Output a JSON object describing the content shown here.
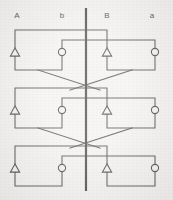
{
  "figure": {
    "background_color": "#f2f1ef",
    "line_color": "#3a3a3a",
    "axis_color": "#2b2b2b",
    "width": 173,
    "height": 200
  },
  "labels": {
    "top_row": [
      {
        "id": "label-A",
        "text": "A",
        "x": 17,
        "y": 18
      },
      {
        "id": "label-b",
        "text": "b",
        "x": 62,
        "y": 18
      },
      {
        "id": "label-B",
        "text": "B",
        "x": 107,
        "y": 18
      },
      {
        "id": "label-a",
        "text": "a",
        "x": 152,
        "y": 18
      }
    ]
  },
  "mirror_axis": {
    "name": "center-vertical-axis",
    "x": 86,
    "y_start": 8,
    "y_end": 191
  },
  "columns": {
    "left_outer_x": 15,
    "left_inner_x": 62,
    "right_inner_x": 107,
    "right_outer_x": 155
  },
  "rows": [
    {
      "index": 0,
      "symbol_y": 52,
      "top_y": 30,
      "bottom_y": 70
    },
    {
      "index": 1,
      "symbol_y": 110,
      "top_y": 88,
      "bottom_y": 128
    },
    {
      "index": 2,
      "symbol_y": 168,
      "top_y": 146,
      "bottom_y": 186
    }
  ],
  "symbols": {
    "triangle": {
      "icon_name": "triangle-node-icon",
      "glyph": "triangle",
      "half_width": 4.6,
      "height": 8.2,
      "count": 6
    },
    "circle": {
      "icon_name": "circle-node-icon",
      "glyph": "circle",
      "radius": 3.6,
      "count": 6
    }
  },
  "cells": [
    {
      "name": "cell-row0-left",
      "row": 0,
      "side": "left",
      "triangle_x": 15,
      "circle_x": 62,
      "symbol_y": 52,
      "top_y": 30,
      "bottom_y": 70,
      "top_extent_x": 86,
      "bottom_extent_x": 62
    },
    {
      "name": "cell-row0-right",
      "row": 0,
      "side": "right",
      "triangle_x": 107,
      "circle_x": 155,
      "symbol_y": 52,
      "top_y": 30,
      "bottom_y": 70,
      "top_extent_x": 86,
      "bottom_extent_x": 107
    },
    {
      "name": "cell-row1-left",
      "row": 1,
      "side": "left",
      "triangle_x": 15,
      "circle_x": 62,
      "symbol_y": 110,
      "top_y": 88,
      "bottom_y": 128,
      "top_extent_x": 86,
      "bottom_extent_x": 62
    },
    {
      "name": "cell-row1-right",
      "row": 1,
      "side": "right",
      "triangle_x": 107,
      "circle_x": 155,
      "symbol_y": 110,
      "top_y": 88,
      "bottom_y": 128,
      "top_extent_x": 86,
      "bottom_extent_x": 107
    },
    {
      "name": "cell-row2-left",
      "row": 2,
      "side": "left",
      "triangle_x": 15,
      "circle_x": 62,
      "symbol_y": 168,
      "top_y": 146,
      "bottom_y": 186,
      "top_extent_x": 86,
      "bottom_extent_x": 62
    },
    {
      "name": "cell-row2-right",
      "row": 2,
      "side": "right",
      "triangle_x": 107,
      "circle_x": 155,
      "symbol_y": 168,
      "top_y": 146,
      "bottom_y": 186,
      "top_extent_x": 86,
      "bottom_extent_x": 107
    }
  ],
  "cross_links": [
    {
      "name": "cross-left-upper",
      "x1": 38,
      "y1": 70,
      "x2": 100,
      "y2": 90
    },
    {
      "name": "cross-right-upper",
      "x1": 132,
      "y1": 70,
      "x2": 70,
      "y2": 90
    },
    {
      "name": "cross-left-lower",
      "x1": 38,
      "y1": 128,
      "x2": 100,
      "y2": 148
    },
    {
      "name": "cross-right-lower",
      "x1": 132,
      "y1": 128,
      "x2": 70,
      "y2": 148
    }
  ]
}
